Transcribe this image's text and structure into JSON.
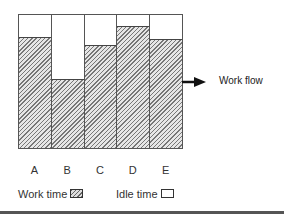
{
  "diagram": {
    "title": "",
    "bars": [
      {
        "label": "A",
        "work_fraction": 0.83
      },
      {
        "label": "B",
        "work_fraction": 0.51
      },
      {
        "label": "C",
        "work_fraction": 0.77
      },
      {
        "label": "D",
        "work_fraction": 0.91
      },
      {
        "label": "E",
        "work_fraction": 0.81
      }
    ],
    "arrow_label": "Work flow",
    "legend": {
      "work": "Work time",
      "idle": "Idle time"
    },
    "colors": {
      "border": "#555555",
      "hatch": "#777777",
      "idle": "#ffffff"
    }
  }
}
